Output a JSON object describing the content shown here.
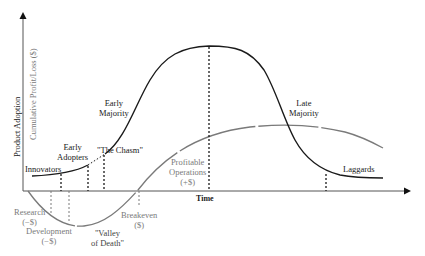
{
  "diagram": {
    "type": "technology adoption lifecycle with cumulative profit/loss curve",
    "axes": {
      "y_primary_label": "Product Adoption",
      "y_secondary_label": "Cumulative Profit/Loss ($)",
      "x_label": "Time"
    },
    "adoption_segments": [
      {
        "label": "Innovators"
      },
      {
        "label": "Early Adopters",
        "line1": "Early",
        "line2": "Adopters"
      },
      {
        "label": "\"The Chasm\""
      },
      {
        "label": "Early Majority",
        "line1": "Early",
        "line2": "Majority"
      },
      {
        "label": "Late Majority",
        "line1": "Late",
        "line2": "Majority"
      },
      {
        "label": "Laggards"
      }
    ],
    "profit_phases": [
      {
        "label": "Research (−$)",
        "line1": "Research",
        "line2": "(−$)"
      },
      {
        "label": "Development (−$)",
        "line1": "Development",
        "line2": "(−$)"
      },
      {
        "label": "\"Valley of Death\"",
        "line1": "\"Valley",
        "line2": "of Death\""
      },
      {
        "label": "Breakeven ($)",
        "line1": "Breakeven",
        "line2": "($)"
      },
      {
        "label": "Profitable Operations (+$)",
        "line1": "Profitable",
        "line2": "Operations",
        "line3": "(+$)"
      }
    ],
    "colors": {
      "adoption_curve": "#1a1a1a",
      "profit_curve": "#7a7a7a",
      "axes": "#555555"
    }
  }
}
